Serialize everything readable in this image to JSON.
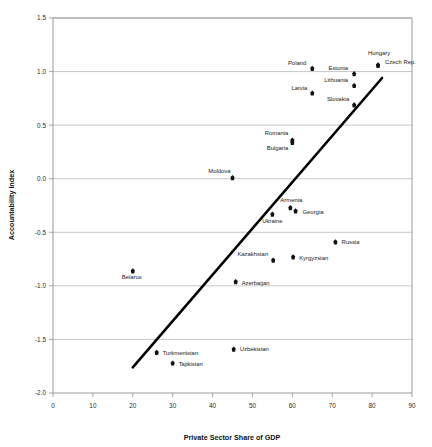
{
  "chart_data": {
    "type": "scatter",
    "title": "",
    "xlabel": "Private Sector Share of GDP",
    "ylabel": "Accountability Index",
    "xlim": [
      0,
      90
    ],
    "ylim": [
      -2.0,
      1.5
    ],
    "xticks": [
      0,
      10,
      20,
      30,
      40,
      50,
      60,
      70,
      80,
      90
    ],
    "yticks": [
      -2.0,
      -1.5,
      -1.0,
      -0.5,
      0.0,
      0.5,
      1.0,
      1.5
    ],
    "xtick_labels": [
      "0",
      "10",
      "20",
      "30",
      "40",
      "50",
      "60",
      "70",
      "80",
      "90"
    ],
    "ytick_labels": [
      "-2.0",
      "-1.5",
      "-1.0",
      "-0.5",
      "0.0",
      "0.5",
      "1.0",
      "1.5"
    ],
    "grid": "horizontal",
    "legend": "none",
    "marker_color": "#111111",
    "trendline_color": "#000000",
    "gridline_color": "#b9b9b9",
    "trendline": {
      "name": "linear fit",
      "x0": 20.0,
      "y0": -1.76,
      "x1": 82.5,
      "y1": 0.94
    },
    "points": [
      {
        "name": "Hungary",
        "x": 81.5,
        "y": 1.06,
        "label_dx": 1,
        "label_dy": -10,
        "label_anchor": "mid"
      },
      {
        "name": "Czech Rep.",
        "x": 81.5,
        "y": 1.06,
        "label_dx": 7,
        "label_dy": -1,
        "label_anchor": "start"
      },
      {
        "name": "Poland",
        "x": 65.0,
        "y": 1.03,
        "label_dx": -6,
        "label_dy": -3,
        "label_anchor": "end"
      },
      {
        "name": "Estonia",
        "x": 75.5,
        "y": 0.98,
        "label_dx": -6,
        "label_dy": -4,
        "label_anchor": "end"
      },
      {
        "name": "Lithuania",
        "x": 75.5,
        "y": 0.87,
        "label_dx": -6,
        "label_dy": -4,
        "label_anchor": "end"
      },
      {
        "name": "Latvia",
        "x": 65.0,
        "y": 0.8,
        "label_dx": -5,
        "label_dy": -3,
        "label_anchor": "end"
      },
      {
        "name": "Slovakia",
        "x": 75.5,
        "y": 0.69,
        "label_dx": -5,
        "label_dy": -4,
        "label_anchor": "end"
      },
      {
        "name": "Romania",
        "x": 60.0,
        "y": 0.36,
        "label_dx": -4,
        "label_dy": -5,
        "label_anchor": "end"
      },
      {
        "name": "Bulgaria",
        "x": 60.0,
        "y": 0.34,
        "label_dx": -4,
        "label_dy": 8,
        "label_anchor": "end"
      },
      {
        "name": "Moldova",
        "x": 45.0,
        "y": 0.01,
        "label_dx": -2,
        "label_dy": -5,
        "label_anchor": "end"
      },
      {
        "name": "Armenia",
        "x": 59.5,
        "y": -0.27,
        "label_dx": 1,
        "label_dy": -6,
        "label_anchor": "mid"
      },
      {
        "name": "Georgia",
        "x": 60.8,
        "y": -0.3,
        "label_dx": 7,
        "label_dy": 3,
        "label_anchor": "start"
      },
      {
        "name": "Ukraine",
        "x": 55.0,
        "y": -0.33,
        "label_dx": 0,
        "label_dy": 9,
        "label_anchor": "mid"
      },
      {
        "name": "Russia",
        "x": 70.8,
        "y": -0.59,
        "label_dx": 6,
        "label_dy": 2,
        "label_anchor": "start"
      },
      {
        "name": "Kazakhstan",
        "x": 55.2,
        "y": -0.76,
        "label_dx": -5,
        "label_dy": -4,
        "label_anchor": "end"
      },
      {
        "name": "Kyrgyzstan",
        "x": 60.2,
        "y": -0.73,
        "label_dx": 6,
        "label_dy": 3,
        "label_anchor": "start"
      },
      {
        "name": "Belarus",
        "x": 20.0,
        "y": -0.86,
        "label_dx": -1,
        "label_dy": 8,
        "label_anchor": "mid"
      },
      {
        "name": "Azerbaijan",
        "x": 45.8,
        "y": -0.96,
        "label_dx": 6,
        "label_dy": 3,
        "label_anchor": "start"
      },
      {
        "name": "Uzbekistan",
        "x": 45.3,
        "y": -1.59,
        "label_dx": 6,
        "label_dy": 2,
        "label_anchor": "start"
      },
      {
        "name": "Turkmenistan",
        "x": 26.0,
        "y": -1.62,
        "label_dx": 6,
        "label_dy": 3,
        "label_anchor": "start"
      },
      {
        "name": "Tajikistan",
        "x": 30.0,
        "y": -1.72,
        "label_dx": 6,
        "label_dy": 3,
        "label_anchor": "start"
      }
    ]
  }
}
